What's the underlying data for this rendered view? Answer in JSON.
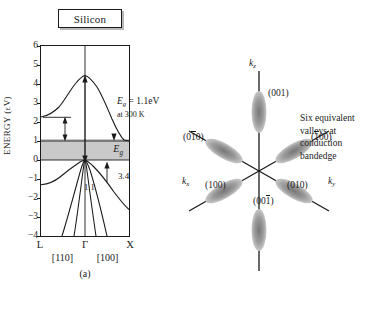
{
  "figure": {
    "panel_a": {
      "title_box": "Silicon",
      "y_axis_label": "ENERGY (eV)",
      "y_ticks": [
        6,
        5,
        4,
        3,
        2,
        1,
        0,
        -1,
        -2,
        -3,
        -4
      ],
      "y_tick_labels": [
        "6",
        "5",
        "4",
        "3",
        "2",
        "1",
        "0",
        "−1",
        "−2",
        "−3",
        "−4"
      ],
      "x_ticks": [
        "L",
        "Γ",
        "X"
      ],
      "x_directions": [
        "[110]",
        "[100]"
      ],
      "annotation_gap": {
        "line1_prefix": "E",
        "line1_sub": "g",
        "line1_rest": " = 1.1eV",
        "line2": "at 300 K"
      },
      "label_indirect_gap": "1.1",
      "label_direct_gap": "3.4",
      "band_gap_symbol": "E",
      "band_gap_symbol_sub": "g",
      "caption": "(a)"
    },
    "panel_b": {
      "axis_kz": {
        "base": "k",
        "sub": "z"
      },
      "axis_kx": {
        "base": "k",
        "sub": "x"
      },
      "axis_ky": {
        "base": "k",
        "sub": "y"
      },
      "valleys": [
        {
          "name": "valley-001",
          "label_pre": "(00",
          "label_bar": "",
          "label_post": "1)"
        },
        {
          "name": "valley-bar100",
          "label_pre": "(",
          "label_bar": "1",
          "label_post": "00)"
        },
        {
          "name": "valley-010",
          "label_pre": "(01",
          "label_bar": "",
          "label_post": "0)"
        },
        {
          "name": "valley-00bar1",
          "label_pre": "(00",
          "label_bar": "1",
          "label_post": ")"
        },
        {
          "name": "valley-100",
          "label_pre": "(10",
          "label_bar": "",
          "label_post": "0)"
        },
        {
          "name": "valley-0bar10",
          "label_pre": "(0",
          "label_bar": "1",
          "label_post": "0)"
        }
      ],
      "caption_text": "Six equivalent valleys at conduction bandedge",
      "caption_lines": [
        "Six equivalent",
        "valleys at",
        "conduction",
        "bandedge"
      ],
      "caption": "(b)"
    }
  },
  "chart_data": {
    "type": "line",
    "title": "Silicon",
    "xlabel": "",
    "ylabel": "ENERGY (eV)",
    "ylim": [
      -4,
      6
    ],
    "x_tick_labels": [
      "L",
      "Γ",
      "X"
    ],
    "x_tick_positions": [
      0,
      0.5,
      1
    ],
    "x_direction_labels": [
      "[110]",
      "[100]"
    ],
    "grid": false,
    "legend": "none",
    "annotations": [
      {
        "text": "Eg = 1.1eV",
        "note": "at 300 K"
      },
      {
        "text": "1.1",
        "meaning": "indirect bandgap in eV"
      },
      {
        "text": "3.4",
        "meaning": "direct gap at Gamma in eV"
      },
      {
        "text": "Eg",
        "meaning": "bandgap shaded band, 0 to 1.1 eV"
      }
    ],
    "shaded_band": {
      "from": 0.0,
      "to": 1.1,
      "color": "#c9c9c9",
      "label": "Eg"
    },
    "series": [
      {
        "name": "conduction band",
        "x": [
          0.0,
          0.08,
          0.16,
          0.24,
          0.32,
          0.4,
          0.46,
          0.5,
          0.56,
          0.62,
          0.68,
          0.74,
          0.8,
          0.86,
          0.92,
          1.0
        ],
        "values": [
          2.25,
          2.28,
          2.4,
          2.63,
          2.98,
          3.4,
          3.62,
          3.65,
          3.52,
          3.22,
          2.78,
          2.28,
          1.8,
          1.42,
          1.18,
          1.1
        ]
      },
      {
        "name": "valence band heavy hole",
        "x": [
          0.0,
          0.1,
          0.2,
          0.3,
          0.4,
          0.5,
          0.6,
          0.7,
          0.8,
          0.9,
          1.0
        ],
        "values": [
          -1.3,
          -1.26,
          -1.16,
          -0.95,
          -0.6,
          0.0,
          -0.6,
          -1.2,
          -1.75,
          -2.2,
          -2.6
        ]
      },
      {
        "name": "valence band light hole",
        "x": [
          0.28,
          0.36,
          0.44,
          0.5,
          0.56,
          0.64,
          0.72
        ],
        "values": [
          -4.0,
          -2.6,
          -1.2,
          0.0,
          -1.1,
          -2.5,
          -4.0
        ]
      },
      {
        "name": "valence band split off",
        "x": [
          0.36,
          0.43,
          0.5,
          0.58,
          0.66
        ],
        "values": [
          -4.0,
          -2.0,
          0.0,
          -2.1,
          -4.0
        ]
      }
    ]
  }
}
